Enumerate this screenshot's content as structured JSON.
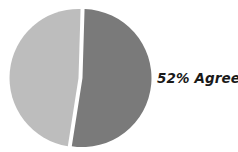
{
  "chart_data": {
    "type": "pie",
    "title": "",
    "slices": [
      {
        "label": "Agree",
        "value": 52,
        "color": "#7a7a7a"
      },
      {
        "label": "",
        "value": 48,
        "color": "#bdbdbd"
      }
    ],
    "annotations": [
      {
        "text": "52% Agree",
        "target": "Agree"
      }
    ],
    "legend": "none",
    "exploded_gap": true
  },
  "labels": {
    "agree": "52% Agree"
  }
}
